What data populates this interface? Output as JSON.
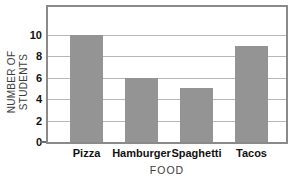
{
  "chart_data": {
    "type": "bar",
    "title": "Favorite Foods",
    "title_cropped": true,
    "categories": [
      "Pizza",
      "Hamburger",
      "Spaghetti",
      "Tacos"
    ],
    "values": [
      10,
      6,
      5,
      9
    ],
    "xlabel": "FOOD",
    "ylabel": "NUMBER OF STUDENTS",
    "yticks": [
      0,
      2,
      4,
      6,
      8,
      10
    ],
    "ylim": [
      0,
      12.6
    ],
    "grid": true,
    "legend": "none",
    "colors": {
      "bar": "#949494",
      "gridline": "#b7b7b7",
      "frame": "#8a8a8a",
      "tick_text": "#111111",
      "axis_text": "#3c3c3c",
      "title_fragment": "#b3b3b3",
      "background": "#ffffff"
    }
  }
}
